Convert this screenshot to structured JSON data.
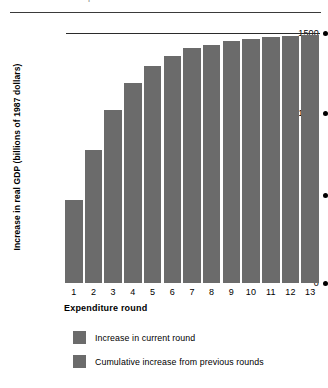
{
  "figure": {
    "top_crumb": "r",
    "background": "#ffffff"
  },
  "chart_data": {
    "type": "bar",
    "title": "",
    "xlabel": "Expenditure round",
    "ylabel": "Increase in real GDP (billions of 1987 dollars)",
    "categories": [
      "1",
      "2",
      "3",
      "4",
      "5",
      "6",
      "7",
      "8",
      "9",
      "10",
      "11",
      "12",
      "13"
    ],
    "values": [
      500,
      800,
      1040,
      1200,
      1300,
      1360,
      1410,
      1430,
      1450,
      1465,
      1475,
      1485,
      1490
    ],
    "ylim": [
      0,
      1500
    ],
    "yticks": [
      0,
      500,
      1000,
      1500
    ],
    "ytick_labels": [
      "0",
      "500",
      "1000",
      "1500"
    ],
    "grid": false,
    "reference_line": {
      "value": 1500,
      "label": "1500"
    },
    "bar_color": "#6b6b6b",
    "series": [
      {
        "name": "Increase in current round",
        "color": "#6b6b6b"
      },
      {
        "name": "Cumulative increase from previous rounds",
        "color": "#6b6b6b"
      }
    ],
    "legend": {
      "position": "bottom",
      "entries": [
        {
          "label": "Increase in current round",
          "color": "#6b6b6b"
        },
        {
          "label": "Cumulative increase from previous rounds",
          "color": "#6b6b6b"
        }
      ]
    }
  }
}
